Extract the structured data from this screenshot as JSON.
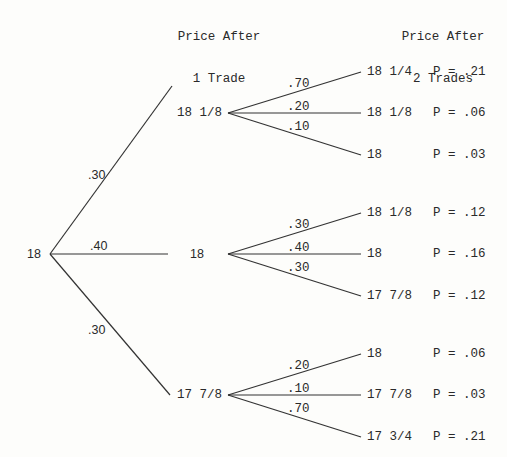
{
  "headers": {
    "after_1": [
      "Price After",
      "1 Trade"
    ],
    "after_2": [
      "Price After",
      "2 Trades"
    ]
  },
  "root": {
    "price": "18"
  },
  "first_level": [
    {
      "price": "18 1/8",
      "prob": ".30",
      "children": [
        {
          "price": "18 1/4",
          "prob": ".70",
          "joint": "P = .21"
        },
        {
          "price": "18 1/8",
          "prob": ".20",
          "joint": "P = .06"
        },
        {
          "price": "18",
          "prob": ".10",
          "joint": "P = .03"
        }
      ]
    },
    {
      "price": "18",
      "prob": ".40",
      "children": [
        {
          "price": "18 1/8",
          "prob": ".30",
          "joint": "P = .12"
        },
        {
          "price": "18",
          "prob": ".40",
          "joint": "P = .16"
        },
        {
          "price": "17 7/8",
          "prob": ".30",
          "joint": "P = .12"
        }
      ]
    },
    {
      "price": "17 7/8",
      "prob": ".30",
      "children": [
        {
          "price": "18",
          "prob": ".20",
          "joint": "P = .06"
        },
        {
          "price": "17 7/8",
          "prob": ".10",
          "joint": "P = .03"
        },
        {
          "price": "17 3/4",
          "prob": ".70",
          "joint": "P = .21"
        }
      ]
    }
  ]
}
